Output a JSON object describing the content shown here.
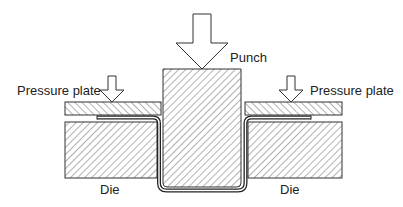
{
  "diagram": {
    "labels": {
      "punch": "Punch",
      "pressure_plate_left": "Pressure plate",
      "pressure_plate_right": "Pressure plate",
      "die_left": "Die",
      "die_right": "Die"
    },
    "colors": {
      "stroke": "#333333",
      "hatch": "#555555",
      "background": "#ffffff"
    }
  }
}
